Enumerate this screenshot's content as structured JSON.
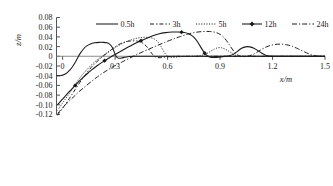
{
  "chart_data": {
    "type": "line",
    "title": "",
    "xlabel": "x/m",
    "ylabel": "z/m",
    "xlim": [
      -0.035,
      1.5
    ],
    "ylim": [
      -0.12,
      0.08
    ],
    "grid": false,
    "legend_position": "top-center",
    "x_ticks": [
      "0",
      "0.3",
      "0.6",
      "0.9",
      "1.2",
      "1.5"
    ],
    "x_tick_values": [
      0,
      0.3,
      0.6,
      0.9,
      1.2,
      1.5
    ],
    "y_ticks": [
      "0.08",
      "0.06",
      "0.04",
      "0.02",
      "0",
      "-0.02",
      "-0.04",
      "-0.06",
      "-0.08",
      "-0.10",
      "-0.12"
    ],
    "y_tick_values": [
      0.08,
      0.06,
      0.04,
      0.02,
      0,
      -0.02,
      -0.04,
      -0.06,
      -0.08,
      -0.1,
      -0.12
    ],
    "series": [
      {
        "name": "0.5h",
        "style": "solid",
        "points": [
          [
            -0.035,
            -0.04
          ],
          [
            -0.015,
            -0.04
          ],
          [
            0.0,
            -0.039
          ],
          [
            0.018,
            -0.036
          ],
          [
            0.035,
            -0.031
          ],
          [
            0.052,
            -0.024
          ],
          [
            0.068,
            -0.015
          ],
          [
            0.082,
            -0.006
          ],
          [
            0.095,
            0.003
          ],
          [
            0.11,
            0.011
          ],
          [
            0.128,
            0.019
          ],
          [
            0.148,
            0.024
          ],
          [
            0.17,
            0.027
          ],
          [
            0.195,
            0.0285
          ],
          [
            0.22,
            0.029
          ],
          [
            0.245,
            0.0285
          ],
          [
            0.262,
            0.027
          ],
          [
            0.275,
            0.0235
          ],
          [
            0.285,
            0.018
          ],
          [
            0.293,
            0.011
          ],
          [
            0.3,
            0.004
          ],
          [
            0.307,
            -0.001
          ],
          [
            0.315,
            -0.0035
          ],
          [
            0.325,
            -0.0042
          ],
          [
            0.34,
            -0.0035
          ],
          [
            0.355,
            -0.002
          ],
          [
            0.372,
            -0.0008
          ],
          [
            0.39,
            0.0
          ],
          [
            0.42,
            0.0
          ],
          [
            0.6,
            0.0
          ],
          [
            0.9,
            0.0
          ],
          [
            1.2,
            0.0
          ],
          [
            1.5,
            0.0
          ]
        ]
      },
      {
        "name": "3h",
        "style": "dashed",
        "points": [
          [
            -0.03,
            -0.122
          ],
          [
            -0.018,
            -0.116
          ],
          [
            0.0,
            -0.107
          ],
          [
            0.02,
            -0.097
          ],
          [
            0.04,
            -0.086
          ],
          [
            0.06,
            -0.075
          ],
          [
            0.08,
            -0.064
          ],
          [
            0.1,
            -0.053
          ],
          [
            0.12,
            -0.043
          ],
          [
            0.142,
            -0.032
          ],
          [
            0.165,
            -0.022
          ],
          [
            0.19,
            -0.013
          ],
          [
            0.215,
            -0.005
          ],
          [
            0.24,
            0.003
          ],
          [
            0.265,
            0.01
          ],
          [
            0.29,
            0.017
          ],
          [
            0.315,
            0.023
          ],
          [
            0.34,
            0.0275
          ],
          [
            0.365,
            0.0305
          ],
          [
            0.39,
            0.0318
          ],
          [
            0.415,
            0.032
          ],
          [
            0.44,
            0.0305
          ],
          [
            0.462,
            0.0265
          ],
          [
            0.48,
            0.0205
          ],
          [
            0.495,
            0.0135
          ],
          [
            0.508,
            0.0065
          ],
          [
            0.52,
            0.0015
          ],
          [
            0.532,
            -0.0018
          ],
          [
            0.548,
            -0.003
          ],
          [
            0.568,
            -0.0026
          ],
          [
            0.59,
            -0.0014
          ],
          [
            0.612,
            -0.0004
          ],
          [
            0.64,
            0.0
          ],
          [
            0.7,
            0.0
          ],
          [
            0.9,
            0.0
          ],
          [
            1.2,
            0.0
          ],
          [
            1.5,
            0.0
          ]
        ]
      },
      {
        "name": "5h",
        "style": "dotted",
        "points": [
          [
            -0.03,
            -0.112
          ],
          [
            -0.015,
            -0.104
          ],
          [
            0.0,
            -0.096
          ],
          [
            0.02,
            -0.086
          ],
          [
            0.04,
            -0.076
          ],
          [
            0.06,
            -0.065
          ],
          [
            0.08,
            -0.054
          ],
          [
            0.1,
            -0.044
          ],
          [
            0.122,
            -0.034
          ],
          [
            0.145,
            -0.025
          ],
          [
            0.17,
            -0.016
          ],
          [
            0.195,
            -0.008
          ],
          [
            0.222,
            -0.001
          ],
          [
            0.25,
            0.006
          ],
          [
            0.278,
            0.013
          ],
          [
            0.305,
            0.019
          ],
          [
            0.335,
            0.0255
          ],
          [
            0.365,
            0.0305
          ],
          [
            0.395,
            0.0345
          ],
          [
            0.425,
            0.0375
          ],
          [
            0.455,
            0.039
          ],
          [
            0.485,
            0.0395
          ],
          [
            0.512,
            0.038
          ],
          [
            0.535,
            0.0335
          ],
          [
            0.552,
            0.0265
          ],
          [
            0.566,
            0.018
          ],
          [
            0.578,
            0.01
          ],
          [
            0.59,
            0.0035
          ],
          [
            0.602,
            -0.0005
          ],
          [
            0.618,
            -0.0022
          ],
          [
            0.64,
            -0.002
          ],
          [
            0.665,
            -0.001
          ],
          [
            0.69,
            -0.0002
          ],
          [
            0.72,
            0.0
          ],
          [
            0.76,
            0.0002
          ],
          [
            0.8,
            0.002
          ],
          [
            0.83,
            0.0065
          ],
          [
            0.856,
            0.0125
          ],
          [
            0.878,
            0.0168
          ],
          [
            0.898,
            0.0182
          ],
          [
            0.918,
            0.0168
          ],
          [
            0.94,
            0.0128
          ],
          [
            0.962,
            0.0075
          ],
          [
            0.982,
            0.003
          ],
          [
            1.0,
            0.0005
          ],
          [
            1.02,
            0.0
          ],
          [
            1.2,
            0.0
          ],
          [
            1.5,
            0.0
          ]
        ]
      },
      {
        "name": "12h",
        "style": "solid-marker",
        "points": [
          [
            -0.03,
            -0.1
          ],
          [
            -0.012,
            -0.093
          ],
          [
            0.005,
            -0.086
          ],
          [
            0.025,
            -0.078
          ],
          [
            0.048,
            -0.069
          ],
          [
            0.072,
            -0.06
          ],
          [
            0.098,
            -0.05
          ],
          [
            0.125,
            -0.041
          ],
          [
            0.152,
            -0.032
          ],
          [
            0.18,
            -0.024
          ],
          [
            0.21,
            -0.016
          ],
          [
            0.24,
            -0.009
          ],
          [
            0.272,
            -0.002
          ],
          [
            0.305,
            0.005
          ],
          [
            0.34,
            0.012
          ],
          [
            0.375,
            0.019
          ],
          [
            0.41,
            0.0255
          ],
          [
            0.448,
            0.032
          ],
          [
            0.488,
            0.0385
          ],
          [
            0.528,
            0.044
          ],
          [
            0.568,
            0.048
          ],
          [
            0.608,
            0.0498
          ],
          [
            0.645,
            0.0502
          ],
          [
            0.68,
            0.0498
          ],
          [
            0.712,
            0.048
          ],
          [
            0.74,
            0.043
          ],
          [
            0.762,
            0.035
          ],
          [
            0.78,
            0.025
          ],
          [
            0.796,
            0.015
          ],
          [
            0.812,
            0.0065
          ],
          [
            0.828,
            0.0008
          ],
          [
            0.845,
            -0.0022
          ],
          [
            0.866,
            -0.0028
          ],
          [
            0.89,
            -0.0018
          ],
          [
            0.915,
            -0.0005
          ],
          [
            0.94,
            0.0
          ],
          [
            0.965,
            0.002
          ],
          [
            0.99,
            0.007
          ],
          [
            1.012,
            0.014
          ],
          [
            1.035,
            0.0188
          ],
          [
            1.058,
            0.0202
          ],
          [
            1.082,
            0.0188
          ],
          [
            1.105,
            0.0145
          ],
          [
            1.128,
            0.0088
          ],
          [
            1.15,
            0.0038
          ],
          [
            1.172,
            0.0008
          ],
          [
            1.192,
            0.0
          ],
          [
            1.25,
            0.0
          ],
          [
            1.5,
            0.0
          ]
        ],
        "markers": [
          [
            0.072,
            -0.06
          ],
          [
            0.24,
            -0.009
          ],
          [
            0.448,
            0.032
          ],
          [
            0.68,
            0.0498
          ],
          [
            0.812,
            0.0065
          ]
        ]
      },
      {
        "name": "24h",
        "style": "dash-dot",
        "points": [
          [
            -0.028,
            -0.118
          ],
          [
            -0.01,
            -0.11
          ],
          [
            0.01,
            -0.102
          ],
          [
            0.035,
            -0.093
          ],
          [
            0.062,
            -0.084
          ],
          [
            0.09,
            -0.074
          ],
          [
            0.12,
            -0.065
          ],
          [
            0.15,
            -0.056
          ],
          [
            0.182,
            -0.047
          ],
          [
            0.215,
            -0.038
          ],
          [
            0.25,
            -0.03
          ],
          [
            0.285,
            -0.022
          ],
          [
            0.322,
            -0.015
          ],
          [
            0.36,
            -0.008
          ],
          [
            0.398,
            -0.001
          ],
          [
            0.438,
            0.006
          ],
          [
            0.478,
            0.0125
          ],
          [
            0.52,
            0.019
          ],
          [
            0.562,
            0.0255
          ],
          [
            0.605,
            0.0318
          ],
          [
            0.648,
            0.0378
          ],
          [
            0.692,
            0.0432
          ],
          [
            0.735,
            0.0478
          ],
          [
            0.778,
            0.0505
          ],
          [
            0.82,
            0.0515
          ],
          [
            0.858,
            0.0508
          ],
          [
            0.89,
            0.0478
          ],
          [
            0.916,
            0.0415
          ],
          [
            0.936,
            0.033
          ],
          [
            0.954,
            0.0235
          ],
          [
            0.97,
            0.0145
          ],
          [
            0.986,
            0.0072
          ],
          [
            1.002,
            0.0022
          ],
          [
            1.02,
            -0.0005
          ],
          [
            1.042,
            -0.0008
          ],
          [
            1.068,
            0.0008
          ],
          [
            1.095,
            0.0048
          ],
          [
            1.125,
            0.0115
          ],
          [
            1.158,
            0.0185
          ],
          [
            1.192,
            0.0232
          ],
          [
            1.228,
            0.0252
          ],
          [
            1.262,
            0.025
          ],
          [
            1.296,
            0.0228
          ],
          [
            1.328,
            0.0185
          ],
          [
            1.36,
            0.013
          ],
          [
            1.392,
            0.0075
          ],
          [
            1.422,
            0.003
          ],
          [
            1.45,
            0.0005
          ],
          [
            1.47,
            0.0
          ],
          [
            1.5,
            0.0
          ]
        ]
      }
    ]
  },
  "legend": {
    "items": [
      {
        "label": "0.5h"
      },
      {
        "label": "3h"
      },
      {
        "label": "5h"
      },
      {
        "label": "12h"
      },
      {
        "label": "24h"
      }
    ]
  }
}
